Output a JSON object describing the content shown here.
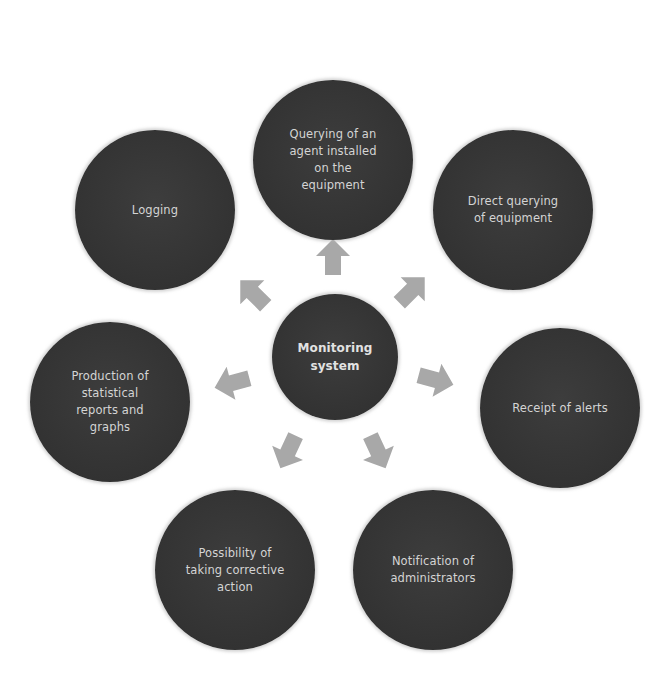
{
  "diagram": {
    "type": "hub-and-spoke",
    "colors": {
      "node_fill": "#353535",
      "node_text": "#d4d4d4",
      "arrow_fill": "#a8a8a8",
      "background": "#ffffff"
    },
    "center": {
      "label": "Monitoring\nsystem"
    },
    "nodes": [
      {
        "id": "agent-querying",
        "label": "Querying of an\nagent installed\non the\nequipment"
      },
      {
        "id": "direct-querying",
        "label": "Direct querying\nof equipment"
      },
      {
        "id": "receipt-alerts",
        "label": "Receipt of alerts"
      },
      {
        "id": "notification-admins",
        "label": "Notification of\nadministrators"
      },
      {
        "id": "corrective-action",
        "label": "Possibility of\ntaking corrective\naction"
      },
      {
        "id": "statistical-reports",
        "label": "Production of\nstatistical\nreports and\ngraphs"
      },
      {
        "id": "logging",
        "label": "Logging"
      }
    ],
    "arrows": [
      {
        "from": "center",
        "to": "agent-querying",
        "direction": "up"
      },
      {
        "from": "center",
        "to": "direct-querying",
        "direction": "up-right"
      },
      {
        "from": "center",
        "to": "receipt-alerts",
        "direction": "right"
      },
      {
        "from": "center",
        "to": "notification-admins",
        "direction": "down-right"
      },
      {
        "from": "center",
        "to": "corrective-action",
        "direction": "down-left"
      },
      {
        "from": "center",
        "to": "statistical-reports",
        "direction": "left"
      },
      {
        "from": "center",
        "to": "logging",
        "direction": "up-left"
      }
    ]
  }
}
